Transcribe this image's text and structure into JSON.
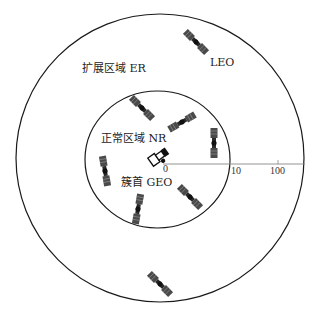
{
  "diagram": {
    "regions": [
      {
        "id": "extended",
        "label": "扩展区域 ER",
        "shape": "circle"
      },
      {
        "id": "normal",
        "label": "正常区域 NR",
        "shape": "circle"
      }
    ],
    "center_node": {
      "label": "簇首 GEO"
    },
    "leo_label": "LEO",
    "axis": {
      "ticks": [
        "0",
        "10",
        "100"
      ]
    },
    "satellites": [
      {
        "region": "extended",
        "x": 196,
        "y": 42,
        "rotation": 45
      },
      {
        "region": "normal",
        "x": 142,
        "y": 108,
        "rotation": 45
      },
      {
        "region": "normal",
        "x": 182,
        "y": 122,
        "rotation": -30
      },
      {
        "region": "normal",
        "x": 214,
        "y": 143,
        "rotation": 90
      },
      {
        "region": "normal",
        "x": 105,
        "y": 171,
        "rotation": 80
      },
      {
        "region": "normal",
        "x": 190,
        "y": 197,
        "rotation": 45
      },
      {
        "region": "normal",
        "x": 138,
        "y": 209,
        "rotation": 100
      },
      {
        "region": "extended",
        "x": 160,
        "y": 284,
        "rotation": 45
      }
    ],
    "colors": {
      "line": "#1a1a1a",
      "axis": "#888888",
      "satellite": "#333333"
    }
  }
}
